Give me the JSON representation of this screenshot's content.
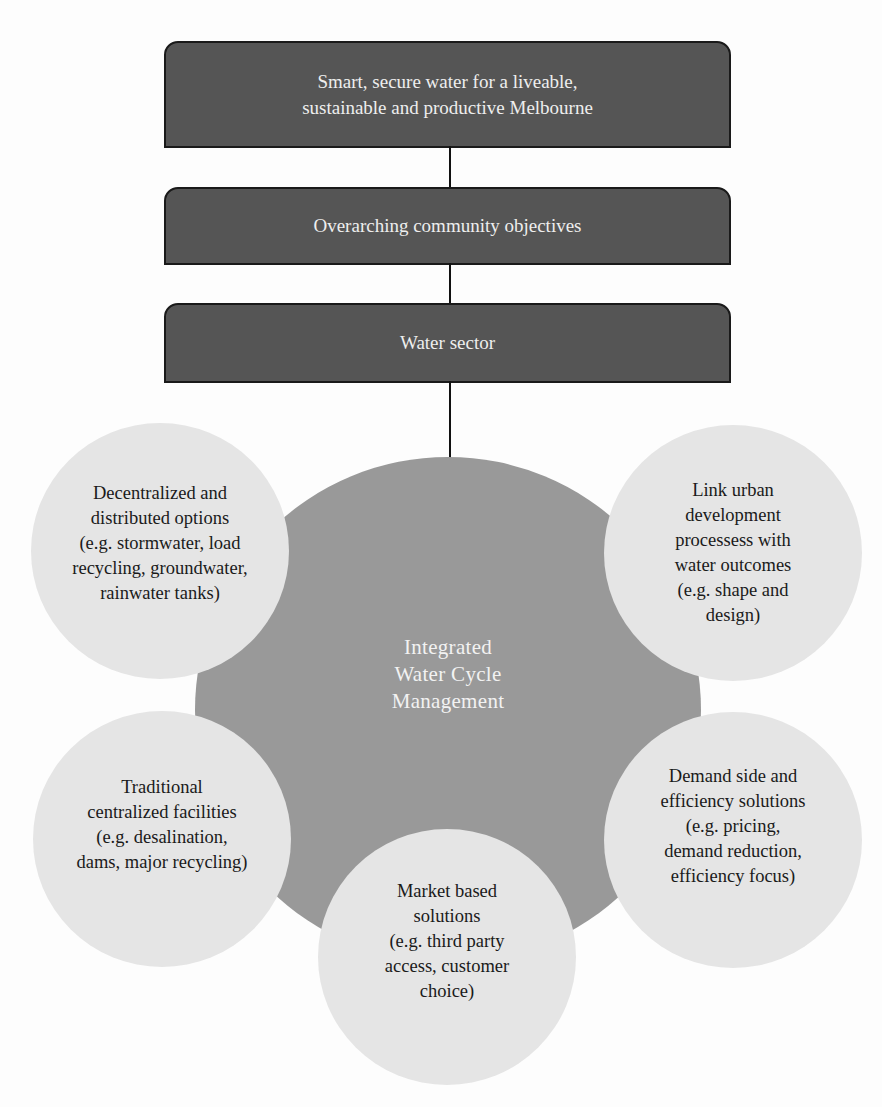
{
  "diagram": {
    "type": "hierarchy-with-radial-cluster",
    "colors": {
      "box_fill": "#555555",
      "box_border": "#1a1a1a",
      "box_text": "#eeeeee",
      "center_fill": "#999999",
      "center_text": "#f2f2f2",
      "option_fill": "#e5e5e5",
      "option_text": "#1a1a1a",
      "connector": "#111111"
    },
    "hierarchy": [
      {
        "id": "vision",
        "label": "Smart, secure water for a liveable,\nsustainable and productive Melbourne"
      },
      {
        "id": "objectives",
        "label": "Overarching community objectives"
      },
      {
        "id": "sector",
        "label": "Water sector"
      }
    ],
    "center": {
      "label": "Integrated\nWater Cycle\nManagement"
    },
    "options": [
      {
        "id": "decentralized",
        "position": "upper-left",
        "label": "Decentralized and\ndistributed options\n(e.g. stormwater, load\nrecycling, groundwater,\nrainwater tanks)"
      },
      {
        "id": "link-urban",
        "position": "upper-right",
        "label": "Link urban\ndevelopment\nprocessess with\nwater outcomes\n(e.g. shape and\ndesign)"
      },
      {
        "id": "traditional",
        "position": "lower-left",
        "label": "Traditional\ncentralized facilities\n(e.g. desalination,\ndams, major recycling)"
      },
      {
        "id": "market",
        "position": "bottom-center",
        "label": "Market based\nsolutions\n(e.g. third party\naccess, customer\nchoice)"
      },
      {
        "id": "demand",
        "position": "lower-right",
        "label": "Demand side and\nefficiency solutions\n(e.g. pricing,\ndemand reduction,\nefficiency focus)"
      }
    ],
    "edges": [
      {
        "from": "vision",
        "to": "objectives"
      },
      {
        "from": "objectives",
        "to": "sector"
      },
      {
        "from": "sector",
        "to": "center"
      }
    ]
  }
}
